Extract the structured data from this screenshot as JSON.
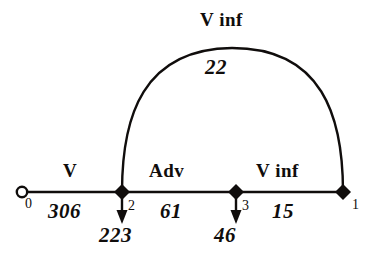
{
  "diagram": {
    "type": "network-flow-graph",
    "stroke_color": "#100d0c",
    "background_color": "#ffffff",
    "nodes": [
      {
        "id": "0",
        "label": "0",
        "shape": "hollow-circle",
        "x": 22,
        "y": 192,
        "label_x": 27,
        "label_y": 196
      },
      {
        "id": "2",
        "label": "2",
        "shape": "filled-diamond",
        "x": 122,
        "y": 192,
        "label_x": 128,
        "label_y": 200
      },
      {
        "id": "3",
        "label": "3",
        "shape": "filled-diamond",
        "x": 236,
        "y": 192,
        "label_x": 242,
        "label_y": 200
      },
      {
        "id": "1",
        "label": "1",
        "shape": "filled-diamond",
        "x": 343,
        "y": 192,
        "label_x": 351,
        "label_y": 198
      }
    ],
    "edges": [
      {
        "from": "0",
        "to": "2",
        "type_label": "V",
        "flow_label": "306",
        "shape": "straight"
      },
      {
        "from": "2",
        "to": "3",
        "type_label": "Adv",
        "flow_label": "61",
        "shape": "straight"
      },
      {
        "from": "3",
        "to": "1",
        "type_label": "V inf",
        "flow_label": "15",
        "shape": "straight"
      },
      {
        "from": "2",
        "to": "1",
        "type_label": "V inf",
        "flow_label": "22",
        "shape": "arc"
      }
    ],
    "node_outflows": [
      {
        "node": "2",
        "value": "223",
        "arrow": "down"
      },
      {
        "node": "3",
        "value": "46",
        "arrow": "down"
      }
    ],
    "labels": {
      "edge_v_top": "V inf",
      "edge_v_top_flow": "22",
      "edge_v": "V",
      "edge_v_flow": "306",
      "edge_adv": "Adv",
      "edge_adv_flow": "61",
      "edge_vinf_bottom": "V inf",
      "edge_vinf_bottom_flow": "15",
      "outflow_2": "223",
      "outflow_3": "46",
      "node_0": "0",
      "node_2": "2",
      "node_3": "3",
      "node_1": "1"
    }
  }
}
